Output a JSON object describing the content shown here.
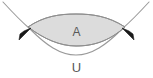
{
  "figure": {
    "background_color": "#ffffff",
    "width": 153,
    "height": 78
  },
  "labels": {
    "area_label": "A",
    "curve_label": "U"
  },
  "colors": {
    "fill": "#dcdcdc",
    "outline": "#8a8a8a",
    "curve": "#9a9a9a",
    "arrow": "#1a1a1a",
    "text": "#595959"
  },
  "elements": {
    "region_name": "shaded-lens-region",
    "upper_curve_name": "upper-boundary-arc",
    "lower_curve_name": "lower-boundary-arc",
    "outer_curve_name": "outer-parabola-curve",
    "left_arrow_name": "left-arrowhead",
    "right_arrow_name": "right-arrowhead"
  },
  "geometry": {
    "left_tip": [
      28,
      27
    ],
    "right_tip": [
      125,
      27
    ],
    "region_top_mid": [
      76,
      16
    ],
    "region_bottom_mid": [
      76,
      45
    ],
    "outer_curve_bottom_mid": [
      76,
      55
    ],
    "left_arrow_tip": [
      30,
      29
    ],
    "right_arrow_tip": [
      123,
      29
    ]
  }
}
